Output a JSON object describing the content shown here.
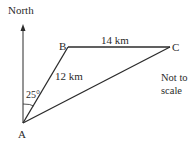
{
  "diagram": {
    "type": "bearing-triangle",
    "north_label": "North",
    "points": {
      "A": {
        "label": "A",
        "x": 23,
        "y": 123
      },
      "B": {
        "label": "B",
        "x": 68,
        "y": 47
      },
      "C": {
        "label": "C",
        "x": 170,
        "y": 47
      }
    },
    "edges": {
      "AB": {
        "length_label": "12 km"
      },
      "BC": {
        "length_label": "14 km"
      },
      "AC": {
        "length_label": ""
      }
    },
    "angle_label": "25°",
    "note_line1": "Not to",
    "note_line2": "scale",
    "colors": {
      "line": "#2b2b2b",
      "text": "#2a2a2a",
      "background": "#ffffff"
    }
  }
}
